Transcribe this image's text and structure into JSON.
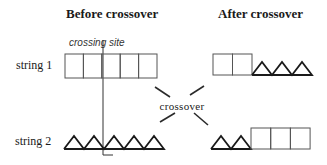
{
  "titles": {
    "before": "Before crossover",
    "after": "After crossover"
  },
  "annotations": {
    "crossing_site": "crossing site",
    "crossover": "crossover"
  },
  "rows": [
    {
      "label": "string 1"
    },
    {
      "label": "string 2"
    }
  ],
  "before": {
    "string1": {
      "pattern": "boxes",
      "count": 5
    },
    "string2": {
      "pattern": "triangles",
      "count": 5
    }
  },
  "after": {
    "string1": {
      "boxes": 2,
      "triangles": 3
    },
    "string2": {
      "triangles": 2,
      "boxes": 3
    }
  },
  "colors": {
    "stroke": "#1a1a1a",
    "box_stroke": "#555555",
    "background": "#ffffff"
  }
}
